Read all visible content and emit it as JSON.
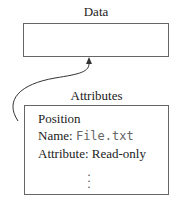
{
  "data_block": {
    "title": "Data"
  },
  "attributes_block": {
    "title": "Attributes",
    "rows": [
      {
        "text": "Position"
      },
      {
        "label": "Name: ",
        "value": "File.txt"
      },
      {
        "text": "Attribute: Read-only"
      }
    ],
    "continuation": "⋮"
  }
}
